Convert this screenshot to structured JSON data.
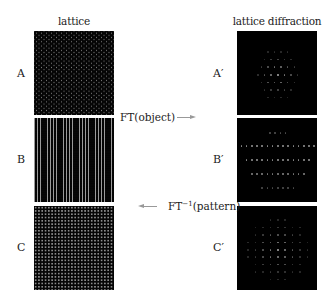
{
  "columns": {
    "left_title": "lattice",
    "right_title": "lattice diffraction"
  },
  "rows": [
    {
      "left_label": "A",
      "right_label": "A′",
      "lattice_type": "hexagonal dot lattice",
      "diffraction_type": "hexagonal spot pattern"
    },
    {
      "left_label": "B",
      "right_label": "B′",
      "lattice_type": "vertical line lattice",
      "diffraction_type": "horizontal rows of spots"
    },
    {
      "left_label": "C",
      "right_label": "C′",
      "lattice_type": "square dot lattice",
      "diffraction_type": "square spot pattern"
    }
  ],
  "operations": {
    "forward": {
      "prefix": "FT",
      "text": "(object)",
      "direction": "right"
    },
    "inverse": {
      "prefix": "FT",
      "superscript": "−1",
      "text": "(pattern)",
      "direction": "left"
    }
  },
  "colors": {
    "background": "#ffffff",
    "panel": "#000000",
    "spot": "#9a9a9a",
    "arrow": "#999999",
    "text": "#222222"
  }
}
